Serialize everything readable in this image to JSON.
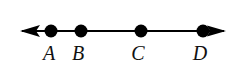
{
  "figure": {
    "background_color": "#ffffff",
    "stroke_color": "#000000",
    "width": 235,
    "height": 74
  },
  "line": {
    "name": "number-line",
    "y": 31,
    "x_start": 20,
    "x_end": 226,
    "thickness": 2,
    "left_arrow": true,
    "right_arrow": true
  },
  "points": [
    {
      "label": "A",
      "x": 51,
      "label_x": 49,
      "radius": 6
    },
    {
      "label": "B",
      "x": 81,
      "label_x": 78,
      "radius": 6
    },
    {
      "label": "C",
      "x": 141,
      "label_x": 138,
      "radius": 6
    },
    {
      "label": "D",
      "x": 203,
      "label_x": 200,
      "radius": 6
    }
  ],
  "labels_baseline_y": 60,
  "chart_data": {
    "type": "scatter",
    "xlabel": "",
    "ylabel": "",
    "grid": false,
    "legend": null,
    "axis_range_px": [
      20,
      226
    ],
    "categories": [
      "A",
      "B",
      "C",
      "D"
    ],
    "x_px": [
      51,
      81,
      141,
      203
    ],
    "values": [
      0,
      0,
      0,
      0
    ],
    "annotations": [
      "Left arrowhead at x=20 indicating the line extends infinitely to the left",
      "Right arrowhead at x=226 indicating the line extends infinitely to the right",
      "Points A, B, C, D appear in left-to-right order on the line"
    ]
  }
}
